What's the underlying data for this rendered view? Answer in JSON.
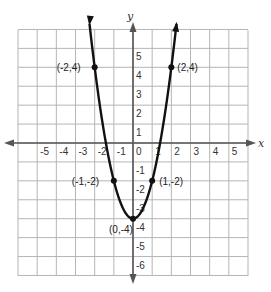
{
  "chart_data": {
    "type": "line",
    "title": "",
    "xlabel": "x",
    "ylabel": "y",
    "xlim": [
      -6,
      6
    ],
    "ylim": [
      -7,
      6
    ],
    "grid": true,
    "x_ticks": [
      "-5",
      "-4",
      "-3",
      "-2",
      "-1",
      "0",
      "1",
      "2",
      "3",
      "4",
      "5"
    ],
    "y_ticks": [
      "5",
      "4",
      "3",
      "2",
      "1",
      "-1",
      "-2",
      "-3",
      "-4",
      "-5",
      "-6"
    ],
    "series": [
      {
        "name": "parabola",
        "equation": "y = 2x^2 - 4",
        "points": [
          {
            "x": -2,
            "y": 4,
            "label": "(-2,4)"
          },
          {
            "x": -1,
            "y": -2,
            "label": "(-1,-2)"
          },
          {
            "x": 0,
            "y": -4,
            "label": "(0,-4)"
          },
          {
            "x": 1,
            "y": -2,
            "label": "(1,-2)"
          },
          {
            "x": 2,
            "y": 4,
            "label": "(2,4)"
          }
        ]
      }
    ]
  },
  "colors": {
    "grid": "#b5b5b5",
    "axis": "#555555",
    "curve": "#111111"
  }
}
